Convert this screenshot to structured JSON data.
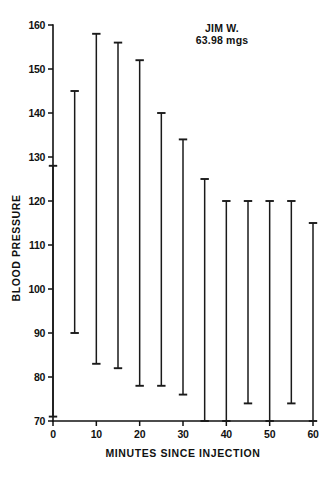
{
  "figure": {
    "background_color": "#ffffff",
    "ink_color": "#111111"
  },
  "annotation": {
    "subject_name": "JIM W.",
    "dose": "63.98 mgs"
  },
  "axes": {
    "y_title": "BLOOD PRESSURE",
    "x_title": "MINUTES SINCE INJECTION",
    "y_ticks": [
      70,
      80,
      90,
      100,
      110,
      120,
      130,
      140,
      150,
      160
    ],
    "x_ticks": [
      0,
      10,
      20,
      30,
      40,
      50,
      60
    ],
    "y_tick_labels": [
      "70",
      "80",
      "90",
      "100",
      "110",
      "120",
      "130",
      "140",
      "150",
      "160"
    ],
    "x_tick_labels": [
      "0",
      "10",
      "20",
      "30",
      "40",
      "50",
      "60"
    ]
  },
  "chart_data": {
    "type": "bar",
    "title": "",
    "subtitle": "JIM W. 63.98 mgs",
    "xlabel": "MINUTES SINCE INJECTION",
    "ylabel": "BLOOD PRESSURE",
    "xlim": [
      0,
      60
    ],
    "ylim": [
      70,
      160
    ],
    "grid": false,
    "legend": "none",
    "marker_style": "I-beam range bar (capped vertical line)",
    "x": [
      0,
      5,
      10,
      15,
      20,
      25,
      30,
      35,
      40,
      45,
      50,
      55,
      60
    ],
    "categories": [
      "0",
      "5",
      "10",
      "15",
      "20",
      "25",
      "30",
      "35",
      "40",
      "45",
      "50",
      "55",
      "60"
    ],
    "series": [
      {
        "name": "Systolic (upper end)",
        "values": [
          128,
          145,
          158,
          156,
          152,
          140,
          134,
          125,
          120,
          120,
          120,
          120,
          115
        ]
      },
      {
        "name": "Diastolic (lower end)",
        "values": [
          71,
          90,
          83,
          82,
          78,
          78,
          76,
          70,
          70,
          74,
          70,
          74,
          70
        ]
      }
    ],
    "ranges": [
      {
        "x": 0,
        "low": 71,
        "high": 128
      },
      {
        "x": 5,
        "low": 90,
        "high": 145
      },
      {
        "x": 10,
        "low": 83,
        "high": 158
      },
      {
        "x": 15,
        "low": 82,
        "high": 156
      },
      {
        "x": 20,
        "low": 78,
        "high": 152
      },
      {
        "x": 25,
        "low": 78,
        "high": 140
      },
      {
        "x": 30,
        "low": 76,
        "high": 134
      },
      {
        "x": 35,
        "low": 70,
        "high": 125
      },
      {
        "x": 40,
        "low": 70,
        "high": 120
      },
      {
        "x": 45,
        "low": 74,
        "high": 120
      },
      {
        "x": 50,
        "low": 70,
        "high": 120
      },
      {
        "x": 55,
        "low": 74,
        "high": 120
      },
      {
        "x": 60,
        "low": 70,
        "high": 115
      }
    ]
  }
}
